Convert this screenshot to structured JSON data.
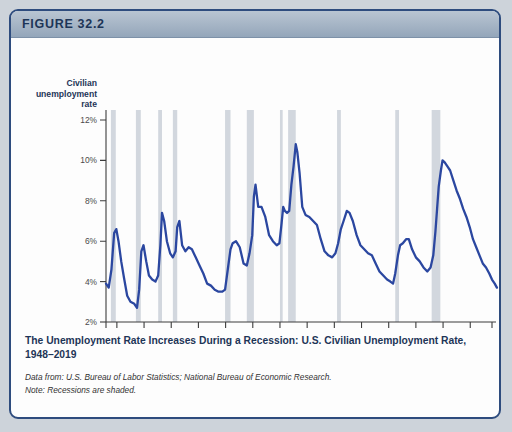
{
  "figure": {
    "label": "FIGURE 32.2",
    "caption_title": "The Unemployment Rate Increases During a Recession: U.S. Civilian Unemployment Rate, 1948–2019",
    "source_line": "Data from: U.S. Bureau of Labor Statistics; National Bureau of Economic Research.",
    "note_line": "Note: Recessions are shaded."
  },
  "colors": {
    "series": "#2b47a0",
    "band": "#d2d7de",
    "header": "#94a6ba",
    "border": "#2e4c7e",
    "title_text": "#1d3557"
  },
  "chart_data": {
    "type": "line",
    "title": "The Unemployment Rate Increases During a Recession: U.S. Civilian Unemployment Rate, 1948–2019",
    "xlabel": "Year",
    "ylabel": "Civilian unemployment rate",
    "ylabel_lines": [
      "Civilian",
      "unemployment",
      "rate"
    ],
    "ylim": [
      2,
      12
    ],
    "xlim": [
      1948,
      2019
    ],
    "grid": false,
    "legend": "none",
    "ytick_labels": [
      "2%",
      "4%",
      "6%",
      "8%",
      "10%",
      "12%"
    ],
    "ytick_values": [
      2,
      4,
      6,
      8,
      10,
      12
    ],
    "xtick_labels": [
      "1948",
      "1950",
      "1955",
      "1960",
      "1965",
      "1970",
      "1975",
      "1980",
      "1985",
      "1990",
      "1995",
      "2000",
      "2005",
      "2010",
      "2015",
      "2019"
    ],
    "xtick_values": [
      1948,
      1950,
      1955,
      1960,
      1965,
      1970,
      1975,
      1980,
      1985,
      1990,
      1995,
      2000,
      2005,
      2010,
      2015,
      2019
    ],
    "series_name": "Civilian unemployment rate",
    "x": [
      1948.0,
      1948.5,
      1949.0,
      1949.5,
      1949.9,
      1950.3,
      1950.8,
      1951.3,
      1951.9,
      1952.5,
      1953.2,
      1953.7,
      1954.1,
      1954.5,
      1954.9,
      1955.4,
      1955.9,
      1956.5,
      1957.1,
      1957.6,
      1958.0,
      1958.3,
      1958.7,
      1959.2,
      1959.8,
      1960.3,
      1960.8,
      1961.1,
      1961.5,
      1962.0,
      1962.6,
      1963.2,
      1963.8,
      1964.5,
      1965.2,
      1965.9,
      1966.6,
      1967.3,
      1968.0,
      1968.7,
      1969.4,
      1969.9,
      1970.4,
      1970.9,
      1971.3,
      1971.9,
      1972.6,
      1973.3,
      1973.9,
      1974.4,
      1974.9,
      1975.2,
      1975.5,
      1976.0,
      1976.6,
      1977.3,
      1978.0,
      1978.7,
      1979.4,
      1979.9,
      1980.3,
      1980.6,
      1980.9,
      1981.3,
      1981.7,
      1982.1,
      1982.5,
      1982.9,
      1983.2,
      1983.6,
      1984.1,
      1984.7,
      1985.4,
      1986.1,
      1986.8,
      1987.5,
      1988.2,
      1988.9,
      1989.6,
      1990.2,
      1990.7,
      1991.2,
      1991.7,
      1992.3,
      1992.8,
      1993.4,
      1994.1,
      1994.8,
      1995.5,
      1996.2,
      1996.9,
      1997.6,
      1998.3,
      1999.0,
      1999.7,
      2000.3,
      2000.8,
      2001.2,
      2001.7,
      2002.1,
      2002.6,
      2003.2,
      2003.7,
      2004.3,
      2005.0,
      2005.7,
      2006.4,
      2007.1,
      2007.7,
      2008.2,
      2008.6,
      2008.9,
      2009.2,
      2009.6,
      2009.9,
      2010.3,
      2010.8,
      2011.3,
      2011.9,
      2012.5,
      2013.1,
      2013.7,
      2014.3,
      2014.9,
      2015.5,
      2016.1,
      2016.7,
      2017.3,
      2017.9,
      2018.5,
      2019.0,
      2019.5,
      2019.9
    ],
    "y": [
      3.9,
      3.7,
      4.6,
      6.4,
      6.6,
      6.0,
      5.0,
      4.2,
      3.3,
      3.0,
      2.9,
      2.7,
      3.6,
      5.5,
      5.8,
      5.0,
      4.3,
      4.1,
      4.0,
      4.3,
      5.8,
      7.4,
      7.0,
      6.0,
      5.4,
      5.2,
      5.5,
      6.7,
      7.0,
      5.8,
      5.5,
      5.7,
      5.6,
      5.2,
      4.8,
      4.4,
      3.9,
      3.8,
      3.6,
      3.5,
      3.5,
      3.6,
      4.6,
      5.6,
      5.9,
      6.0,
      5.7,
      4.9,
      4.8,
      5.4,
      6.3,
      8.2,
      8.8,
      7.7,
      7.7,
      7.2,
      6.3,
      6.0,
      5.8,
      5.9,
      6.9,
      7.7,
      7.5,
      7.4,
      7.5,
      8.8,
      9.7,
      10.8,
      10.4,
      9.4,
      7.7,
      7.3,
      7.2,
      7.0,
      6.8,
      6.1,
      5.5,
      5.3,
      5.2,
      5.4,
      5.9,
      6.6,
      7.0,
      7.5,
      7.4,
      7.0,
      6.3,
      5.8,
      5.6,
      5.4,
      5.3,
      4.9,
      4.5,
      4.3,
      4.1,
      4.0,
      3.9,
      4.4,
      5.3,
      5.8,
      5.9,
      6.1,
      6.1,
      5.6,
      5.2,
      5.0,
      4.7,
      4.5,
      4.7,
      5.3,
      6.5,
      7.6,
      8.7,
      9.5,
      10.0,
      9.9,
      9.7,
      9.5,
      9.0,
      8.5,
      8.1,
      7.6,
      7.2,
      6.7,
      6.1,
      5.7,
      5.3,
      4.9,
      4.7,
      4.4,
      4.1,
      3.9,
      3.7,
      3.6
    ],
    "annotations": [
      {
        "label": "peak 1982",
        "year": 1982.9,
        "value": 10.8
      },
      {
        "label": "peak 2009",
        "year": 2009.6,
        "value": 10.0
      },
      {
        "label": "trough 1953",
        "year": 1953.2,
        "value": 2.9
      },
      {
        "label": "end 2019",
        "year": 2019.9,
        "value": 3.6
      }
    ],
    "recessions": [
      {
        "start": 1948.9,
        "end": 1949.8
      },
      {
        "start": 1953.5,
        "end": 1954.4
      },
      {
        "start": 1957.6,
        "end": 1958.3
      },
      {
        "start": 1960.3,
        "end": 1961.1
      },
      {
        "start": 1969.9,
        "end": 1970.9
      },
      {
        "start": 1973.9,
        "end": 1975.2
      },
      {
        "start": 1980.0,
        "end": 1980.5
      },
      {
        "start": 1981.5,
        "end": 1982.9
      },
      {
        "start": 1990.5,
        "end": 1991.2
      },
      {
        "start": 2001.2,
        "end": 2001.9
      },
      {
        "start": 2007.9,
        "end": 2009.5
      }
    ]
  }
}
